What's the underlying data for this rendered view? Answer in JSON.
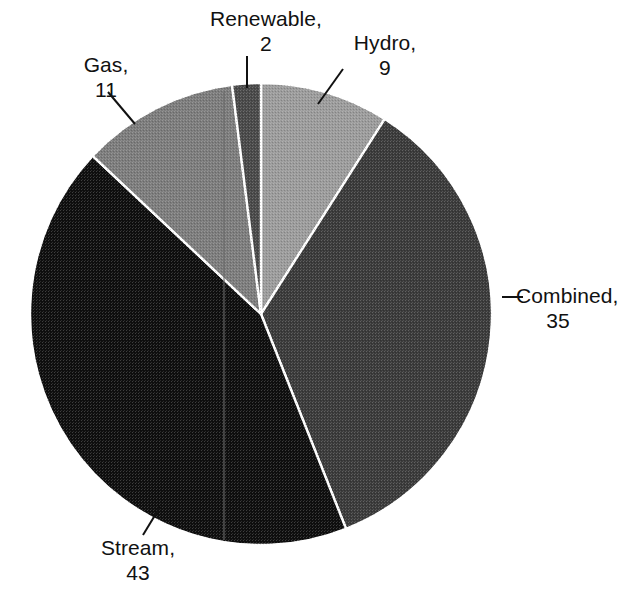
{
  "chart_data": {
    "type": "pie",
    "title": "",
    "subtitle": "",
    "xlabel": "",
    "ylabel": "",
    "legend_position": "none",
    "grid": false,
    "total": 100,
    "start_angle_deg": 0,
    "direction": "clockwise",
    "categories": [
      "Hydro",
      "Combined",
      "Stream",
      "Gas",
      "Renewable"
    ],
    "values": [
      9,
      35,
      43,
      11,
      2
    ],
    "slices": [
      {
        "name": "Hydro",
        "value": 9,
        "label_text": "Hydro,",
        "value_text": "9",
        "color": "#9c9c9c",
        "start_deg": 0,
        "end_deg": 32.4,
        "leader": true
      },
      {
        "name": "Combined",
        "value": 35,
        "label_text": "Combined,",
        "value_text": "35",
        "color": "#3b3b3b",
        "start_deg": 32.4,
        "end_deg": 158.4,
        "leader": true
      },
      {
        "name": "Stream",
        "value": 43,
        "label_text": "Stream,",
        "value_text": "43",
        "color": "#0f0f0f",
        "start_deg": 158.4,
        "end_deg": 313.2,
        "leader": true
      },
      {
        "name": "Gas",
        "value": 11,
        "label_text": "Gas,",
        "value_text": "11",
        "color": "#7d7d7d",
        "start_deg": 313.2,
        "end_deg": 352.8,
        "leader": true
      },
      {
        "name": "Renewable",
        "value": 2,
        "label_text": "Renewable,",
        "value_text": "2",
        "color": "#4a4a4a",
        "start_deg": 352.8,
        "end_deg": 360,
        "leader": true
      }
    ],
    "colors": {
      "hydro": "#9c9c9c",
      "combined": "#3b3b3b",
      "stream": "#0f0f0f",
      "gas": "#7d7d7d",
      "renewable": "#4a4a4a",
      "slice_border": "#ffffff",
      "leader_line": "#111111",
      "label_text": "#111111",
      "background": "#ffffff"
    },
    "geometry": {
      "center_x": 261,
      "center_y": 314,
      "radius": 231
    }
  }
}
